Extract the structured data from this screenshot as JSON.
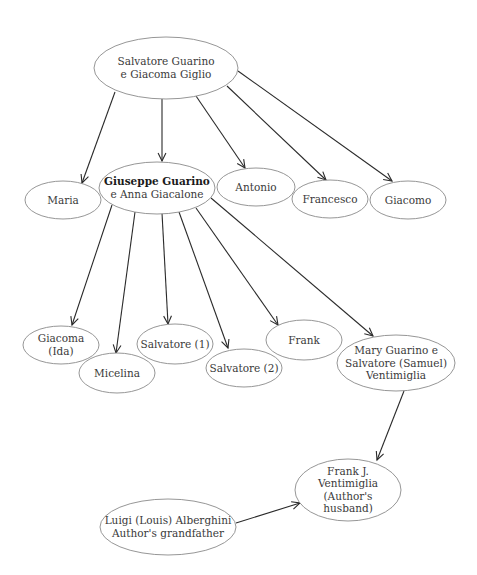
{
  "diagram": {
    "type": "family-tree",
    "colors": {
      "background": "#ffffff",
      "node_stroke": "#8a8a8a",
      "edge_stroke": "#2a2a2a",
      "text": "#3a3a3a"
    },
    "nodes": [
      {
        "id": "salvatore_giacoma",
        "lines": [
          "Salvatore Guarino",
          "e Giacoma Giglio"
        ],
        "bold_line": null,
        "cx": 166,
        "cy": 68,
        "rx": 72,
        "ry": 31
      },
      {
        "id": "maria",
        "lines": [
          "Maria"
        ],
        "bold_line": null,
        "cx": 63,
        "cy": 200,
        "rx": 38,
        "ry": 19
      },
      {
        "id": "giuseppe_anna",
        "lines": [
          "Giuseppe Guarino",
          "e Anna Giacalone"
        ],
        "bold_line": 0,
        "cx": 157,
        "cy": 188,
        "rx": 58,
        "ry": 26
      },
      {
        "id": "antonio",
        "lines": [
          "Antonio"
        ],
        "bold_line": null,
        "cx": 256,
        "cy": 187,
        "rx": 39,
        "ry": 19
      },
      {
        "id": "francesco",
        "lines": [
          "Francesco"
        ],
        "bold_line": null,
        "cx": 330,
        "cy": 199,
        "rx": 38,
        "ry": 19
      },
      {
        "id": "giacomo",
        "lines": [
          "Giacomo"
        ],
        "bold_line": null,
        "cx": 408,
        "cy": 200,
        "rx": 38,
        "ry": 19
      },
      {
        "id": "giacoma_ida",
        "lines": [
          "Giacoma",
          "(Ida)"
        ],
        "bold_line": null,
        "cx": 61,
        "cy": 345,
        "rx": 38,
        "ry": 19
      },
      {
        "id": "micelina",
        "lines": [
          "Micelina"
        ],
        "bold_line": null,
        "cx": 117,
        "cy": 373,
        "rx": 38,
        "ry": 20
      },
      {
        "id": "salvatore_1",
        "lines": [
          "Salvatore (1)"
        ],
        "bold_line": null,
        "cx": 175,
        "cy": 344,
        "rx": 38,
        "ry": 20
      },
      {
        "id": "salvatore_2",
        "lines": [
          "Salvatore (2)"
        ],
        "bold_line": null,
        "cx": 244,
        "cy": 368,
        "rx": 38,
        "ry": 19
      },
      {
        "id": "frank",
        "lines": [
          "Frank"
        ],
        "bold_line": null,
        "cx": 304,
        "cy": 340,
        "rx": 38,
        "ry": 20
      },
      {
        "id": "mary_salvatore",
        "lines": [
          "Mary Guarino e",
          "Salvatore (Samuel)",
          "Ventimiglia"
        ],
        "bold_line": null,
        "cx": 396,
        "cy": 363,
        "rx": 59,
        "ry": 28
      },
      {
        "id": "frank_j",
        "lines": [
          "Frank J.",
          "Ventimiglia",
          "(Author's",
          "husband)"
        ],
        "bold_line": null,
        "cx": 348,
        "cy": 490,
        "rx": 53,
        "ry": 31
      },
      {
        "id": "luigi",
        "lines": [
          "Luigi (Louis) Alberghini",
          "Author's grandfather"
        ],
        "bold_line": null,
        "cx": 168,
        "cy": 527,
        "rx": 68,
        "ry": 28
      }
    ],
    "edges": [
      {
        "from": "salvatore_giacoma",
        "to": "maria",
        "x1": 115,
        "y1": 92,
        "x2": 82,
        "y2": 183
      },
      {
        "from": "salvatore_giacoma",
        "to": "giuseppe_anna",
        "x1": 162,
        "y1": 99,
        "x2": 162,
        "y2": 161
      },
      {
        "from": "salvatore_giacoma",
        "to": "antonio",
        "x1": 196,
        "y1": 96,
        "x2": 245,
        "y2": 168
      },
      {
        "from": "salvatore_giacoma",
        "to": "francesco",
        "x1": 227,
        "y1": 86,
        "x2": 326,
        "y2": 180
      },
      {
        "from": "salvatore_giacoma",
        "to": "giacomo",
        "x1": 238,
        "y1": 71,
        "x2": 392,
        "y2": 181
      },
      {
        "from": "giuseppe_anna",
        "to": "giacoma_ida",
        "x1": 112,
        "y1": 205,
        "x2": 72,
        "y2": 325
      },
      {
        "from": "giuseppe_anna",
        "to": "micelina",
        "x1": 135,
        "y1": 212,
        "x2": 116,
        "y2": 353
      },
      {
        "from": "giuseppe_anna",
        "to": "salvatore_1",
        "x1": 162,
        "y1": 213,
        "x2": 168,
        "y2": 324
      },
      {
        "from": "giuseppe_anna",
        "to": "salvatore_2",
        "x1": 179,
        "y1": 212,
        "x2": 228,
        "y2": 348
      },
      {
        "from": "giuseppe_anna",
        "to": "frank",
        "x1": 196,
        "y1": 208,
        "x2": 278,
        "y2": 325
      },
      {
        "from": "giuseppe_anna",
        "to": "mary_salvatore",
        "x1": 211,
        "y1": 198,
        "x2": 373,
        "y2": 336
      },
      {
        "from": "mary_salvatore",
        "to": "frank_j",
        "x1": 404,
        "y1": 391,
        "x2": 377,
        "y2": 460
      },
      {
        "from": "luigi",
        "to": "frank_j",
        "x1": 236,
        "y1": 523,
        "x2": 300,
        "y2": 503
      }
    ]
  }
}
